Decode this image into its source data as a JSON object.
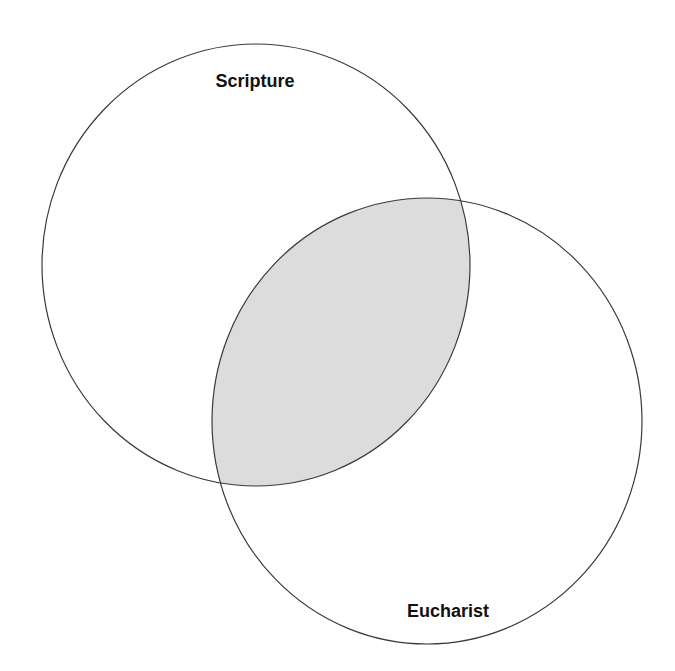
{
  "diagram": {
    "type": "venn",
    "sets": [
      {
        "id": "scripture",
        "label": "Scripture",
        "shape": {
          "cx": 256,
          "cy": 265,
          "rx": 214,
          "ry": 221
        },
        "label_pos": {
          "x": 255,
          "y": 87
        }
      },
      {
        "id": "eucharist",
        "label": "Eucharist",
        "shape": {
          "cx": 427,
          "cy": 421,
          "rx": 215,
          "ry": 223
        },
        "label_pos": {
          "x": 448,
          "y": 617
        }
      }
    ],
    "intersection": {
      "sets": [
        "scripture",
        "eucharist"
      ],
      "fill": "#dcdcdc",
      "label": ""
    },
    "colors": {
      "background": "#ffffff",
      "outline": "#3a3a3a",
      "intersection_fill": "#dcdcdc",
      "label": "#111111"
    }
  }
}
